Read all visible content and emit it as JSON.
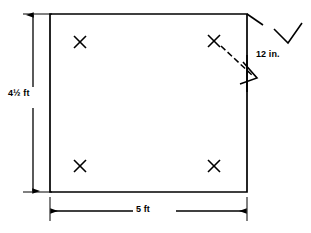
{
  "figure": {
    "type": "technical-drawing",
    "stroke_color": "#000000",
    "background_color": "#ffffff",
    "dimensions": {
      "height_label": "4½ ft",
      "width_label": "5 ft",
      "depth_label": "12 in."
    },
    "shape": {
      "name": "rectangle",
      "left": 50,
      "top": 14,
      "right": 247,
      "bottom": 192,
      "stroke_width": 1.6
    },
    "markers": [
      {
        "name": "corner-marker-top-left",
        "x": 80,
        "y": 42,
        "glyph": "X"
      },
      {
        "name": "corner-marker-top-right",
        "x": 214,
        "y": 41,
        "glyph": "X"
      },
      {
        "name": "corner-marker-bottom-left",
        "x": 80,
        "y": 166,
        "glyph": "X"
      },
      {
        "name": "corner-marker-bottom-right",
        "x": 214,
        "y": 166,
        "glyph": "X"
      }
    ],
    "leaders": {
      "depth_dashed_line": {
        "x1": 222,
        "y1": 47,
        "x2": 253,
        "y2": 76
      },
      "corner_tick": {
        "x1": 247,
        "y1": 14,
        "x2": 262,
        "y2": 24
      },
      "check_mark": {
        "points": "276,30 288,42 301,24"
      }
    }
  }
}
